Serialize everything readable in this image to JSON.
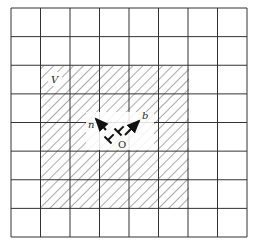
{
  "diagram": {
    "grid": {
      "x0": 11,
      "y0": 8,
      "x1": 247,
      "y1": 237,
      "cols": 8,
      "rows": 8,
      "line_color": "#333333"
    },
    "shaded_region": {
      "col_start": 1,
      "col_end": 6,
      "row_start": 2,
      "row_end": 7,
      "hatch_color": "#555555",
      "label": "V"
    },
    "dislocation": {
      "origin_label": "O",
      "vectors": [
        {
          "name": "n",
          "label": "n",
          "direction": "up-left"
        },
        {
          "name": "b",
          "label": "b",
          "direction": "up-right"
        }
      ],
      "symbols": [
        "⊥",
        "⊥"
      ]
    }
  }
}
